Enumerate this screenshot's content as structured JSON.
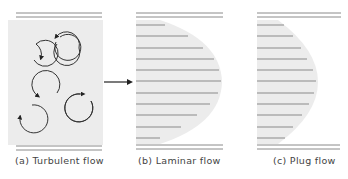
{
  "colors": {
    "background": "#ffffff",
    "panel_fill": "#ececec",
    "line": "#8a8a8a",
    "ink": "#333333",
    "caption_text": "#444444"
  },
  "panels": [
    {
      "id": "turbulent",
      "caption": "(a) Turbulent flow",
      "description": "Randomly oriented circular eddies with arrowheads"
    },
    {
      "id": "laminar",
      "caption": "(b) Laminar flow",
      "description": "Parabolic velocity profile with horizontal streamlines"
    },
    {
      "id": "plug",
      "caption": "(c) Plug flow",
      "description": "Flattened velocity profile with horizontal streamlines"
    }
  ],
  "arrow": {
    "description": "Flow direction arrow pointing right"
  }
}
